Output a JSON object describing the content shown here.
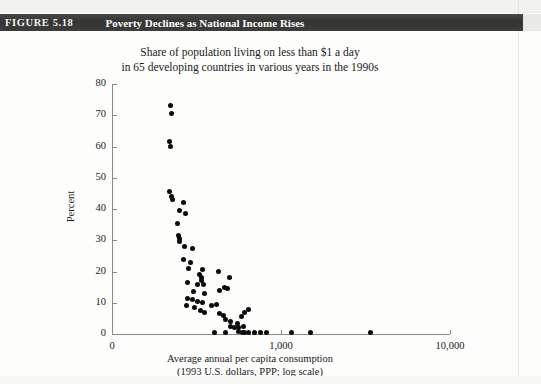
{
  "figure": {
    "label": "FIGURE 5.18",
    "title": "Poverty Declines as National Income Rises",
    "bar_color": "#3b3b3b",
    "bar_text_color": "#ffffff"
  },
  "chart_title": {
    "line1": "Share of population living on less than $1 a day",
    "line2": "in 65 developing countries in various years in the 1990s"
  },
  "axis_caption": {
    "line1": "Average annual per capita consumption",
    "line2": "(1993 U.S. dollars, PPP; log scale)"
  },
  "chart_data": {
    "type": "scatter",
    "title": "Share of population living on less than $1 a day in 65 developing countries in various years in the 1990s",
    "xlabel": "Average annual per capita consumption (1993 U.S. dollars, PPP; log scale)",
    "ylabel": "Percent",
    "xscale": "log",
    "yscale": "linear",
    "ylim": [
      0,
      80
    ],
    "ytick_labels": [
      "0",
      "10",
      "20",
      "30",
      "40",
      "50",
      "60",
      "70",
      "80"
    ],
    "ytick_values": [
      0,
      10,
      20,
      30,
      40,
      50,
      60,
      70,
      80
    ],
    "xtick_labels": [
      "0",
      "1,000",
      "10,000"
    ],
    "xtick_values": [
      100,
      1000,
      10000
    ],
    "grid": false,
    "legend": null,
    "marker_color": "#0b0b0b",
    "n_points": 65,
    "points": [
      [
        222,
        73.0
      ],
      [
        225,
        70.5
      ],
      [
        218,
        61.5
      ],
      [
        222,
        60.0
      ],
      [
        218,
        45.5
      ],
      [
        224,
        44.0
      ],
      [
        228,
        43.0
      ],
      [
        265,
        42.0
      ],
      [
        252,
        39.5
      ],
      [
        272,
        38.5
      ],
      [
        243,
        35.5
      ],
      [
        247,
        31.5
      ],
      [
        250,
        30.5
      ],
      [
        252,
        29.5
      ],
      [
        270,
        28.0
      ],
      [
        300,
        27.5
      ],
      [
        265,
        24.0
      ],
      [
        292,
        23.0
      ],
      [
        285,
        21.0
      ],
      [
        345,
        20.5
      ],
      [
        330,
        19.0
      ],
      [
        338,
        18.0
      ],
      [
        424,
        20.0
      ],
      [
        340,
        17.0
      ],
      [
        278,
        16.5
      ],
      [
        320,
        16.0
      ],
      [
        350,
        16.0
      ],
      [
        498,
        18.0
      ],
      [
        466,
        15.0
      ],
      [
        305,
        13.5
      ],
      [
        352,
        13.0
      ],
      [
        430,
        14.0
      ],
      [
        484,
        14.5
      ],
      [
        278,
        11.5
      ],
      [
        300,
        11.0
      ],
      [
        322,
        10.5
      ],
      [
        345,
        10.0
      ],
      [
        276,
        9.0
      ],
      [
        308,
        8.5
      ],
      [
        388,
        9.0
      ],
      [
        416,
        9.5
      ],
      [
        332,
        7.5
      ],
      [
        352,
        7.0
      ],
      [
        612,
        7.0
      ],
      [
        640,
        8.0
      ],
      [
        430,
        6.5
      ],
      [
        455,
        6.0
      ],
      [
        580,
        5.5
      ],
      [
        470,
        4.5
      ],
      [
        505,
        4.0
      ],
      [
        552,
        3.5
      ],
      [
        500,
        2.5
      ],
      [
        528,
        2.0
      ],
      [
        560,
        2.0
      ],
      [
        596,
        2.5
      ],
      [
        402,
        0.6
      ],
      [
        470,
        0.5
      ],
      [
        560,
        0.8
      ],
      [
        590,
        0.5
      ],
      [
        612,
        0.6
      ],
      [
        640,
        0.4
      ],
      [
        700,
        0.5
      ],
      [
        760,
        0.4
      ],
      [
        820,
        0.6
      ],
      [
        1150,
        0.4
      ],
      [
        1500,
        0.5
      ],
      [
        3400,
        0.4
      ]
    ]
  }
}
